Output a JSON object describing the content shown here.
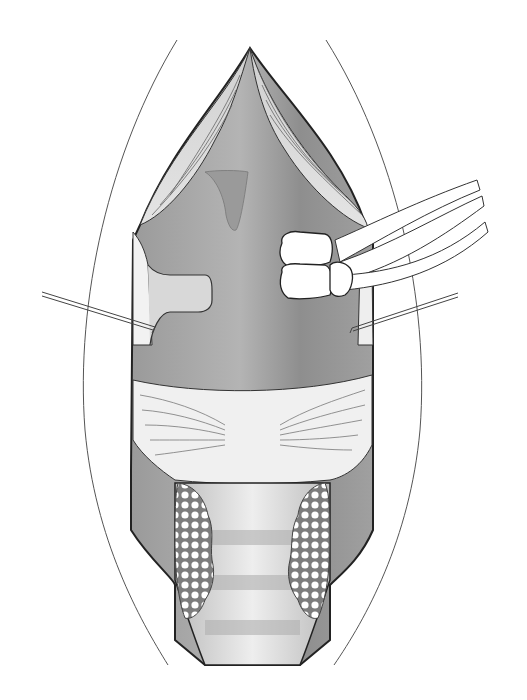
{
  "figure": {
    "type": "surgical-anatomical-illustration",
    "labels": [],
    "colors": {
      "background": "#ffffff",
      "outline": "#2a2a2a",
      "cavity_dark": "#8c8c8c",
      "cavity_mid": "#a8a8a8",
      "muscle_light": "#d6d6d6",
      "band_light": "#ececec",
      "tissue_pale": "#f4f4f4",
      "gland_dots": "#7a7a7a"
    },
    "elements": [
      "outer-incision-curves",
      "upper-muscle-flap",
      "central-cavity",
      "uvula-like-projection",
      "left-retractor",
      "right-retractor",
      "left-hook-wire",
      "right-hook-wire",
      "tied-sling-knot",
      "sling-strands",
      "transverse-muscle-band",
      "lower-tubular-segment",
      "left-glandular-cluster",
      "right-glandular-cluster"
    ]
  }
}
